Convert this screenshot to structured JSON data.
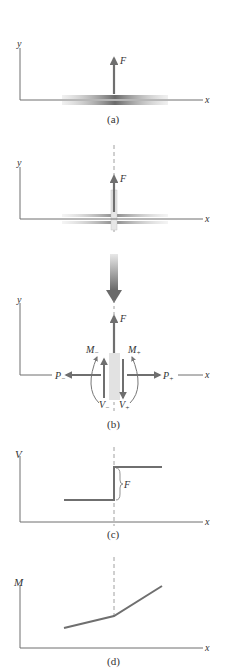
{
  "colors": {
    "axis": "#6e6e6e",
    "force": "#6f6f6f",
    "beam": "#8a8a8a",
    "text": "#333333",
    "dashed": "#888888"
  },
  "panel_a": {
    "caption": "(a)",
    "x_axis_label": "x",
    "y_axis_label": "y",
    "force_label": "F"
  },
  "panel_b": {
    "caption": "(b)",
    "top": {
      "x_axis_label": "x",
      "y_axis_label": "y",
      "force_label": "F"
    },
    "bottom": {
      "x_axis_label": "x",
      "y_axis_label": "y",
      "force_label": "F",
      "moment_left": "M",
      "moment_left_sub": "−",
      "moment_right": "M",
      "moment_right_sub": "+",
      "axial_left": "P",
      "axial_left_sub": "−",
      "axial_right": "P",
      "axial_right_sub": "+",
      "shear_left": "V",
      "shear_left_sub": "−",
      "shear_right": "V",
      "shear_right_sub": "+"
    }
  },
  "panel_c": {
    "caption": "(c)",
    "x_axis_label": "x",
    "y_axis_label": "V",
    "jump_label": "F"
  },
  "panel_d": {
    "caption": "(d)",
    "x_axis_label": "x",
    "y_axis_label": "M"
  }
}
